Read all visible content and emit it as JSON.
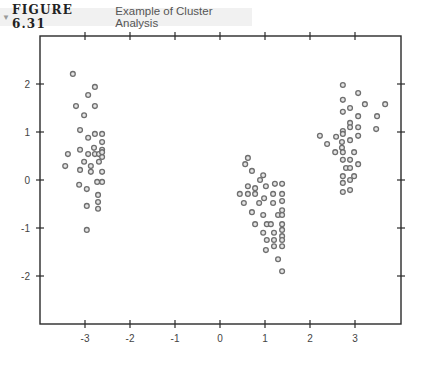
{
  "figure": {
    "label": "FIGURE 6.31",
    "title": "Example of Cluster Analysis",
    "marker_icon": "triangle-down-icon"
  },
  "chart_data": {
    "type": "scatter",
    "title": "Example of Cluster Analysis",
    "xlabel": "",
    "ylabel": "",
    "xlim": [
      -3.9,
      4.0
    ],
    "ylim": [
      -3.0,
      3.0
    ],
    "xticks": [
      -3,
      -2,
      -1,
      0,
      1,
      2,
      3
    ],
    "xtick_labels": [
      "-3",
      "-2",
      "-1",
      "0",
      "1",
      "2",
      "3"
    ],
    "yticks": [
      2,
      1,
      0,
      -1,
      -2
    ],
    "ytick_labels": [
      "2",
      "1",
      "0",
      "-1",
      "-2"
    ],
    "grid": false,
    "legend": null,
    "marker": "hollow-circle",
    "marker_color": "#6e6e6e",
    "series": [
      {
        "name": "Cluster 1",
        "points": [
          [
            -3.27,
            2.21
          ],
          [
            -2.78,
            1.94
          ],
          [
            -2.93,
            1.77
          ],
          [
            -3.2,
            1.54
          ],
          [
            -2.78,
            1.54
          ],
          [
            -3.02,
            1.35
          ],
          [
            -3.11,
            1.04
          ],
          [
            -2.93,
            0.88
          ],
          [
            -2.78,
            0.96
          ],
          [
            -2.62,
            0.96
          ],
          [
            -2.62,
            0.79
          ],
          [
            -2.8,
            0.67
          ],
          [
            -3.11,
            0.63
          ],
          [
            -3.38,
            0.54
          ],
          [
            -2.93,
            0.54
          ],
          [
            -2.78,
            0.54
          ],
          [
            -2.69,
            0.54
          ],
          [
            -2.62,
            0.63
          ],
          [
            -2.62,
            0.48
          ],
          [
            -2.62,
            0.58
          ],
          [
            -3.44,
            0.29
          ],
          [
            -3.02,
            0.38
          ],
          [
            -2.87,
            0.29
          ],
          [
            -2.69,
            0.38
          ],
          [
            -3.11,
            0.21
          ],
          [
            -2.87,
            0.17
          ],
          [
            -2.62,
            0.17
          ],
          [
            -2.62,
            -0.04
          ],
          [
            -2.73,
            -0.04
          ],
          [
            -3.13,
            -0.1
          ],
          [
            -2.96,
            -0.19
          ],
          [
            -2.71,
            -0.31
          ],
          [
            -2.71,
            -0.46
          ],
          [
            -2.96,
            -0.54
          ],
          [
            -2.71,
            -0.6
          ],
          [
            -2.96,
            -1.04
          ]
        ]
      },
      {
        "name": "Cluster 2",
        "points": [
          [
            0.62,
            0.46
          ],
          [
            0.56,
            0.33
          ],
          [
            0.71,
            0.19
          ],
          [
            0.96,
            0.1
          ],
          [
            0.89,
            0.0
          ],
          [
            0.62,
            -0.13
          ],
          [
            0.78,
            -0.17
          ],
          [
            1.02,
            -0.13
          ],
          [
            1.22,
            -0.08
          ],
          [
            1.38,
            -0.08
          ],
          [
            0.44,
            -0.29
          ],
          [
            0.62,
            -0.29
          ],
          [
            0.78,
            -0.29
          ],
          [
            1.18,
            -0.29
          ],
          [
            1.38,
            -0.29
          ],
          [
            0.53,
            -0.48
          ],
          [
            0.87,
            -0.48
          ],
          [
            0.98,
            -0.38
          ],
          [
            1.18,
            -0.48
          ],
          [
            1.38,
            -0.44
          ],
          [
            1.38,
            -0.63
          ],
          [
            0.71,
            -0.67
          ],
          [
            0.96,
            -0.73
          ],
          [
            1.29,
            -0.73
          ],
          [
            1.38,
            -0.73
          ],
          [
            0.78,
            -0.92
          ],
          [
            1.04,
            -0.92
          ],
          [
            1.13,
            -0.92
          ],
          [
            1.38,
            -0.92
          ],
          [
            0.96,
            -1.1
          ],
          [
            1.2,
            -1.1
          ],
          [
            1.38,
            -1.04
          ],
          [
            1.38,
            -1.17
          ],
          [
            1.04,
            -1.25
          ],
          [
            1.2,
            -1.25
          ],
          [
            1.38,
            -1.25
          ],
          [
            1.02,
            -1.46
          ],
          [
            1.2,
            -1.38
          ],
          [
            1.38,
            -1.38
          ],
          [
            1.29,
            -1.65
          ],
          [
            1.38,
            -1.9
          ]
        ]
      },
      {
        "name": "Cluster 3",
        "points": [
          [
            2.73,
            1.98
          ],
          [
            3.07,
            1.81
          ],
          [
            2.73,
            1.67
          ],
          [
            3.22,
            1.58
          ],
          [
            3.67,
            1.58
          ],
          [
            2.73,
            1.42
          ],
          [
            2.89,
            1.5
          ],
          [
            3.07,
            1.33
          ],
          [
            3.49,
            1.33
          ],
          [
            2.89,
            1.19
          ],
          [
            2.73,
            1.02
          ],
          [
            2.89,
            1.1
          ],
          [
            3.07,
            1.1
          ],
          [
            3.47,
            1.06
          ],
          [
            2.22,
            0.92
          ],
          [
            2.58,
            0.9
          ],
          [
            2.73,
            0.96
          ],
          [
            3.07,
            0.92
          ],
          [
            2.38,
            0.75
          ],
          [
            2.71,
            0.79
          ],
          [
            2.71,
            0.67
          ],
          [
            2.89,
            0.83
          ],
          [
            2.56,
            0.58
          ],
          [
            2.73,
            0.58
          ],
          [
            2.98,
            0.58
          ],
          [
            2.73,
            0.42
          ],
          [
            2.89,
            0.42
          ],
          [
            3.07,
            0.33
          ],
          [
            2.8,
            0.25
          ],
          [
            2.89,
            0.25
          ],
          [
            2.73,
            0.08
          ],
          [
            2.98,
            0.08
          ],
          [
            2.73,
            -0.06
          ],
          [
            2.89,
            0.0
          ],
          [
            2.73,
            -0.25
          ],
          [
            2.89,
            -0.21
          ]
        ]
      }
    ]
  }
}
